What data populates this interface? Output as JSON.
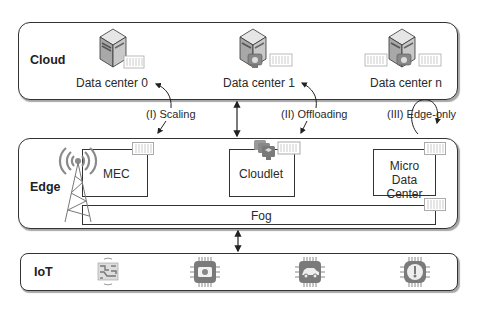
{
  "cloud": {
    "label": "Cloud",
    "data_centers": [
      {
        "label": "Data center 0"
      },
      {
        "label": "Data center 1"
      },
      {
        "label": "Data center n"
      }
    ]
  },
  "edge": {
    "label": "Edge",
    "nodes": {
      "mec": "MEC",
      "cloudlet": "Cloudlet",
      "micro_dc_line1": "Micro",
      "micro_dc_line2": "Data Center",
      "fog": "Fog"
    }
  },
  "iot": {
    "label": "IoT",
    "devices": [
      {
        "icon": "circuit-board-icon"
      },
      {
        "icon": "camera-chip-icon"
      },
      {
        "icon": "car-chip-icon"
      },
      {
        "icon": "thermometer-chip-icon"
      }
    ]
  },
  "annotations": {
    "scaling": "(I) Scaling",
    "offloading": "(II) Offloading",
    "edge_only": "(III) Edge-only"
  },
  "colors": {
    "border": "#333333",
    "icon_gray": "#7a7a7a",
    "icon_light": "#b8b8b8"
  }
}
